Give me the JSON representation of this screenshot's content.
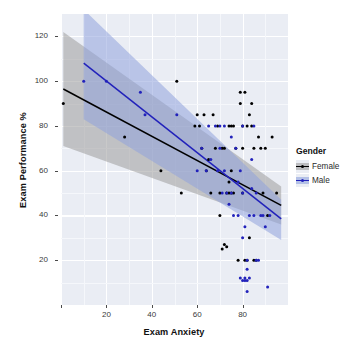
{
  "chart_data": {
    "type": "scatter",
    "title": "",
    "xlabel": "Exam Anxiety",
    "ylabel": "Exam Performance %",
    "xlim": [
      0,
      100
    ],
    "ylim": [
      0,
      130
    ],
    "xticks": [
      0,
      20,
      40,
      60,
      80
    ],
    "xtick_labels": [
      "",
      "20",
      "40",
      "60",
      "80"
    ],
    "yticks": [
      20,
      40,
      60,
      80,
      100,
      120
    ],
    "ytick_labels": [
      "20",
      "40",
      "60",
      "80",
      "100",
      "120"
    ],
    "grid": true,
    "legend": {
      "title": "Gender",
      "position": "right",
      "entries": [
        {
          "label": "Female",
          "color": "#000000",
          "band_color": "#9c9c9c"
        },
        {
          "label": "Male",
          "color": "#2222bb",
          "band_color": "#8fa3dd"
        }
      ]
    },
    "series": [
      {
        "name": "Female",
        "color": "#000000",
        "fit": {
          "type": "linear",
          "x0": 1.0,
          "y0": 96.5,
          "x1": 97.0,
          "y1": 44.5
        },
        "band": {
          "x0": 1.0,
          "x1": 97.0,
          "upper_y0": 122.0,
          "upper_y1": 53.0,
          "lower_y0": 71.0,
          "lower_y1": 36.0
        },
        "points": [
          [
            1,
            90
          ],
          [
            28,
            75
          ],
          [
            44,
            60
          ],
          [
            51,
            100
          ],
          [
            53,
            50
          ],
          [
            59,
            80
          ],
          [
            60,
            85
          ],
          [
            61,
            80
          ],
          [
            62,
            70
          ],
          [
            63,
            85
          ],
          [
            64,
            60
          ],
          [
            65,
            65
          ],
          [
            66,
            50
          ],
          [
            67,
            85
          ],
          [
            68,
            70
          ],
          [
            69,
            80
          ],
          [
            70,
            50
          ],
          [
            70,
            40
          ],
          [
            71,
            70
          ],
          [
            71,
            25
          ],
          [
            72,
            70
          ],
          [
            72,
            27
          ],
          [
            73,
            50
          ],
          [
            73,
            26
          ],
          [
            74,
            80
          ],
          [
            74,
            50
          ],
          [
            74,
            55
          ],
          [
            75,
            50
          ],
          [
            75,
            80
          ],
          [
            75,
            60
          ],
          [
            76,
            80
          ],
          [
            76,
            50
          ],
          [
            77,
            70
          ],
          [
            78,
            20
          ],
          [
            79,
            90
          ],
          [
            79,
            95
          ],
          [
            80,
            80
          ],
          [
            80,
            70
          ],
          [
            80,
            50
          ],
          [
            81,
            95
          ],
          [
            81,
            20
          ],
          [
            82,
            80
          ],
          [
            82,
            20
          ],
          [
            83,
            85
          ],
          [
            83,
            30
          ],
          [
            84,
            90
          ],
          [
            84,
            80
          ],
          [
            85,
            70
          ],
          [
            85,
            20
          ],
          [
            86,
            20
          ],
          [
            87,
            75
          ],
          [
            88,
            70
          ],
          [
            89,
            50
          ],
          [
            90,
            70
          ],
          [
            91,
            40
          ],
          [
            93,
            75
          ],
          [
            95,
            50
          ]
        ]
      },
      {
        "name": "Male",
        "color": "#2222bb",
        "fit": {
          "type": "linear",
          "x0": 10.0,
          "y0": 108.0,
          "x1": 97.0,
          "y1": 38.5
        },
        "band": {
          "x0": 10.0,
          "x1": 97.0,
          "upper_y0": 132.0,
          "upper_y1": 47.0,
          "lower_y0": 83.0,
          "lower_y1": 29.0
        },
        "points": [
          [
            10,
            100
          ],
          [
            20,
            100
          ],
          [
            35,
            95
          ],
          [
            37,
            85
          ],
          [
            51,
            85
          ],
          [
            60,
            60
          ],
          [
            62,
            70
          ],
          [
            64,
            60
          ],
          [
            65,
            80
          ],
          [
            66,
            65
          ],
          [
            68,
            80
          ],
          [
            69,
            60
          ],
          [
            70,
            80
          ],
          [
            70,
            70
          ],
          [
            71,
            50
          ],
          [
            72,
            80
          ],
          [
            72,
            60
          ],
          [
            73,
            50
          ],
          [
            74,
            45
          ],
          [
            75,
            50
          ],
          [
            75,
            75
          ],
          [
            76,
            40
          ],
          [
            77,
            70
          ],
          [
            78,
            55
          ],
          [
            78,
            40
          ],
          [
            79,
            60
          ],
          [
            79,
            12
          ],
          [
            80,
            80
          ],
          [
            80,
            50
          ],
          [
            80,
            11
          ],
          [
            80,
            30
          ],
          [
            81,
            11
          ],
          [
            81,
            35
          ],
          [
            81,
            12
          ],
          [
            82,
            20
          ],
          [
            82,
            16
          ],
          [
            82,
            6
          ],
          [
            82,
            11
          ],
          [
            83,
            40
          ],
          [
            83,
            12
          ],
          [
            84,
            52
          ],
          [
            84,
            65
          ],
          [
            85,
            40
          ],
          [
            85,
            80
          ],
          [
            86,
            50
          ],
          [
            86,
            20
          ],
          [
            87,
            20
          ],
          [
            88,
            40
          ],
          [
            89,
            40
          ],
          [
            90,
            35
          ],
          [
            91,
            8
          ],
          [
            92,
            40
          ]
        ]
      }
    ]
  },
  "panel": {
    "bg_color": "#eaedf4",
    "grid_major_color": "#ffffff",
    "grid_minor_color": "#f5f7fb"
  }
}
